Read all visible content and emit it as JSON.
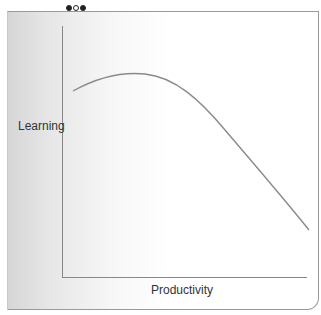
{
  "diagram": {
    "title_clipped": true,
    "indicator_dots": [
      "filled",
      "hollow",
      "filled"
    ],
    "y_axis_label": "Learning",
    "x_axis_label": "Productivity",
    "curve": {
      "shape": "inverted-u, rising then falling",
      "color": "#8a8a8a",
      "points": [
        [
          73,
          91
        ],
        [
          135,
          74
        ],
        [
          200,
          110
        ],
        [
          309,
          230
        ]
      ]
    },
    "colors": {
      "axis": "#888888",
      "panel_gradient_start": "#d6d6d6",
      "panel_gradient_end": "#ffffff"
    }
  }
}
